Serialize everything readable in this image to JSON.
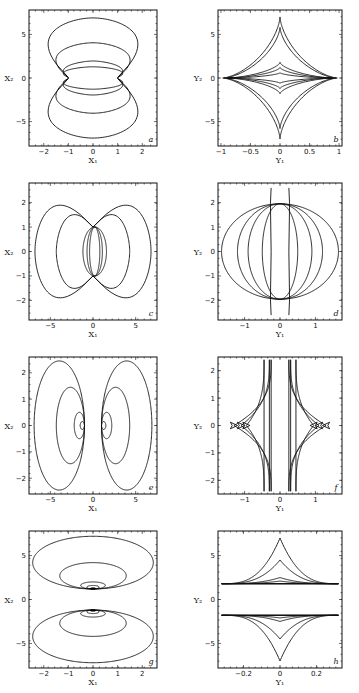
{
  "chart_data": [
    {
      "panel": "a",
      "type": "line",
      "xlabel": "X1",
      "ylabel": "X2",
      "xlim": [
        -2.6,
        2.6
      ],
      "ylim": [
        -7.8,
        7.8
      ],
      "xticks": [
        -2,
        -1,
        0,
        1,
        2
      ],
      "yticks": [
        -5,
        0,
        5
      ],
      "description": "Closed curves pinched at (±1, 0); nested level sets",
      "curves": [
        {
          "kind": "bowtie_y",
          "x0": 1.0,
          "top": 7.2,
          "xmax": 2.45
        },
        {
          "kind": "bowtie_y",
          "x0": 1.0,
          "top": 4.2,
          "xmax": 1.75
        },
        {
          "kind": "bowtie_y",
          "x0": 1.0,
          "top": 2.0,
          "xmax": 1.0
        },
        {
          "kind": "bowtie_y",
          "x0": 1.0,
          "top": 1.3,
          "xmax": 1.0
        }
      ]
    },
    {
      "panel": "b",
      "type": "line",
      "xlabel": "Y1",
      "ylabel": "Y2",
      "xlim": [
        -1.05,
        1.05
      ],
      "ylim": [
        -7.8,
        7.8
      ],
      "xticks": [
        -1.0,
        -0.5,
        0,
        0.5,
        1.0
      ],
      "yticks": [
        -5,
        0,
        5
      ],
      "description": "Nested astroid-like curves with cusps on axes",
      "curves": [
        {
          "kind": "astroid",
          "ax": 0.97,
          "ay": 7.0
        },
        {
          "kind": "astroid",
          "ax": 0.95,
          "ay": 5.8
        },
        {
          "kind": "astroid",
          "ax": 0.9,
          "ay": 1.8
        },
        {
          "kind": "astroid",
          "ax": 0.88,
          "ay": 1.2
        },
        {
          "kind": "astroid",
          "ax": 0.85,
          "ay": 0.6
        }
      ]
    },
    {
      "panel": "c",
      "type": "line",
      "xlabel": "X1",
      "ylabel": "X2",
      "xlim": [
        -7.5,
        7.5
      ],
      "ylim": [
        -2.8,
        2.8
      ],
      "xticks": [
        -5,
        0,
        5
      ],
      "yticks": [
        -2,
        -1,
        0,
        1,
        2
      ],
      "description": "Butterfly-shaped closed curves pinched at (0, ±1)",
      "curves": [
        {
          "kind": "bowtie_x",
          "y0": 1.0,
          "side": 6.8,
          "ymax": 2.6
        },
        {
          "kind": "bowtie_x",
          "y0": 1.0,
          "side": 4.3,
          "ymax": 1.75
        },
        {
          "kind": "oval",
          "rx": 2.3,
          "ry": 1.0
        },
        {
          "kind": "oval",
          "rx": 1.5,
          "ry": 1.0
        },
        {
          "kind": "oval",
          "rx": 1.0,
          "ry": 1.0
        }
      ]
    },
    {
      "panel": "d",
      "type": "line",
      "xlabel": "Y1",
      "ylabel": "Y2",
      "xlim": [
        -1.75,
        1.75
      ],
      "ylim": [
        -2.8,
        2.8
      ],
      "xticks": [
        -1,
        0,
        1
      ],
      "yticks": [
        -2,
        -1,
        0,
        1,
        2
      ],
      "description": "Lens-shaped curves meeting near (±0.35, ±2)",
      "curves": [
        {
          "kind": "lens",
          "rx": 1.65,
          "ry": 1.95
        },
        {
          "kind": "lens",
          "rx": 1.2,
          "ry": 1.95
        },
        {
          "kind": "lens",
          "rx": 0.9,
          "ry": 1.95
        },
        {
          "kind": "lens",
          "rx": 0.5,
          "ry": 1.95
        },
        {
          "kind": "vline",
          "x": 0.25,
          "ymax": 2.6
        }
      ]
    },
    {
      "panel": "e",
      "type": "line",
      "xlabel": "X1",
      "ylabel": "X2",
      "xlim": [
        -7.5,
        7.5
      ],
      "ylim": [
        -2.6,
        2.6
      ],
      "xticks": [
        -5,
        0,
        5
      ],
      "yticks": [
        -2,
        -1,
        0,
        1,
        2
      ],
      "description": "Two families of nested closed loops on either side of origin",
      "curves": [
        {
          "kind": "side_loop",
          "inner": 1.0,
          "outer": 6.9,
          "ymax": 2.45
        },
        {
          "kind": "side_loop",
          "inner": 1.0,
          "outer": 4.3,
          "ymax": 1.45
        },
        {
          "kind": "side_loop",
          "inner": 1.0,
          "outer": 2.2,
          "ymax": 0.5
        },
        {
          "kind": "side_loop",
          "inner": 1.0,
          "outer": 1.5,
          "ymax": 0.15
        }
      ]
    },
    {
      "panel": "f",
      "type": "line",
      "xlabel": "Y1",
      "ylabel": "Y2",
      "xlim": [
        -1.75,
        1.75
      ],
      "ylim": [
        -2.5,
        2.5
      ],
      "xticks": [
        -1,
        0,
        1
      ],
      "yticks": [
        -2,
        -1,
        0,
        1,
        2
      ],
      "description": "Cusped curves near vertical lines Y1 = ±0.25, with small swallowtails near |Y1| ≈ 1",
      "curves": [
        {
          "kind": "cusp_f",
          "x0": 0.25,
          "tip": 1.3
        },
        {
          "kind": "cusp_f",
          "x0": 0.3,
          "tip": 1.1
        },
        {
          "kind": "cusp_f",
          "x0": 0.45,
          "tip": 0.95
        }
      ]
    },
    {
      "panel": "g",
      "type": "line",
      "xlabel": "X1",
      "ylabel": "X2",
      "xlim": [
        -2.6,
        2.6
      ],
      "ylim": [
        -7.8,
        7.8
      ],
      "xticks": [
        -2,
        -1,
        0,
        1,
        2
      ],
      "yticks": [
        -5,
        0,
        5
      ],
      "description": "Two families of nested closed curves above and below the X1 axis",
      "curves": [
        {
          "kind": "cap",
          "base": 1.2,
          "top": 7.2,
          "xmax": 2.45
        },
        {
          "kind": "cap",
          "base": 1.2,
          "top": 4.2,
          "xmax": 1.35
        },
        {
          "kind": "cap",
          "base": 1.2,
          "top": 2.0,
          "xmax": 0.5
        },
        {
          "kind": "cap",
          "base": 1.2,
          "top": 1.6,
          "xmax": 0.25
        },
        {
          "kind": "cap",
          "base": 1.2,
          "top": 1.35,
          "xmax": 0.1
        }
      ]
    },
    {
      "panel": "h",
      "type": "line",
      "xlabel": "Y1",
      "ylabel": "Y2",
      "xlim": [
        -0.34,
        0.34
      ],
      "ylim": [
        -7.8,
        7.8
      ],
      "xticks": [
        -0.2,
        0,
        0.2
      ],
      "yticks": [
        -5,
        0,
        5
      ],
      "description": "Cusped curves above and below a gap around Y2 = 0",
      "curves": [
        {
          "kind": "cusp_h",
          "base": 1.8,
          "tip": 7.0,
          "xmax": 0.32
        },
        {
          "kind": "cusp_h",
          "base": 1.8,
          "tip": 4.5,
          "xmax": 0.32
        },
        {
          "kind": "cusp_h",
          "base": 1.8,
          "tip": 2.5,
          "xmax": 0.32
        },
        {
          "kind": "cusp_h",
          "base": 1.8,
          "tip": 2.1,
          "xmax": 0.32
        }
      ]
    }
  ],
  "panels": [
    {
      "id": "a",
      "label": "a",
      "xlabel": "X₁",
      "ylabel": "X₂"
    },
    {
      "id": "b",
      "label": "b",
      "xlabel": "Y₁",
      "ylabel": "Y₂"
    },
    {
      "id": "c",
      "label": "c",
      "xlabel": "X₁",
      "ylabel": "X₂"
    },
    {
      "id": "d",
      "label": "d",
      "xlabel": "Y₁",
      "ylabel": "Y₂"
    },
    {
      "id": "e",
      "label": "e",
      "xlabel": "X₁",
      "ylabel": "X₂"
    },
    {
      "id": "f",
      "label": "f",
      "xlabel": "Y₁",
      "ylabel": "Y₂"
    },
    {
      "id": "g",
      "label": "g",
      "xlabel": "X₁",
      "ylabel": "X₂"
    },
    {
      "id": "h",
      "label": "h",
      "xlabel": "Y₁",
      "ylabel": "Y₂"
    }
  ]
}
